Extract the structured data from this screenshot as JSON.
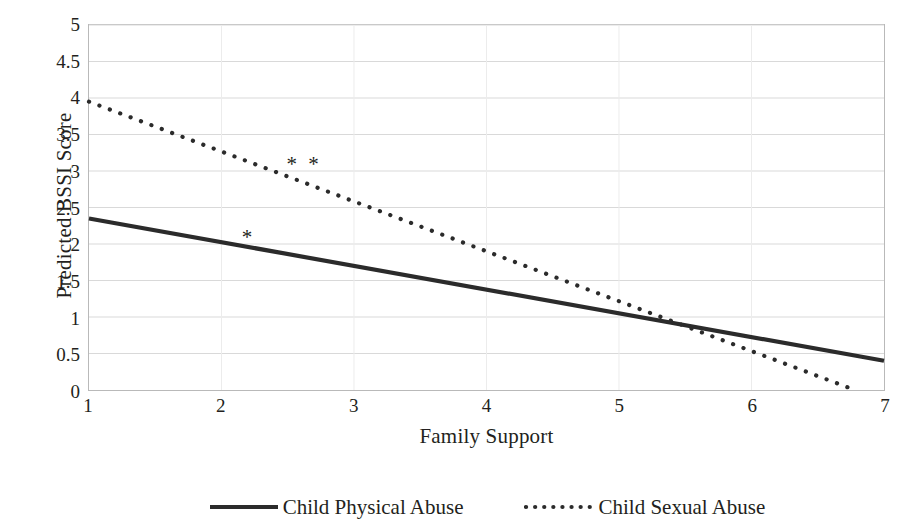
{
  "chart_data": {
    "type": "line",
    "title": "",
    "xlabel": "Family Support",
    "ylabel": "Predicted BSSI Score",
    "xlim": [
      1,
      7
    ],
    "ylim": [
      0,
      5
    ],
    "x_ticks": [
      "1",
      "2",
      "3",
      "4",
      "5",
      "6",
      "7"
    ],
    "y_ticks": [
      "0",
      "0.5",
      "1",
      "1.5",
      "2",
      "2.5",
      "3",
      "3.5",
      "4",
      "4.5",
      "5"
    ],
    "grid": "horizontal",
    "legend_position": "bottom",
    "series": [
      {
        "name": "Child Physical Abuse",
        "style": "solid",
        "color": "#2b2b2b",
        "x": [
          1,
          7
        ],
        "values": [
          2.35,
          0.4
        ]
      },
      {
        "name": "Child Sexual Abuse",
        "style": "dotted",
        "color": "#2b2b2b",
        "x": [
          1,
          6.78
        ],
        "values": [
          3.95,
          0.0
        ]
      }
    ],
    "annotations": [
      {
        "text": "*",
        "x": 2.2,
        "y": 2.18,
        "series": "Child Physical Abuse"
      },
      {
        "text": "* *",
        "x": 2.62,
        "y": 3.17,
        "series": "Child Sexual Abuse"
      }
    ]
  },
  "axes": {
    "y_title": "Predicted BSSI Score",
    "x_title": "Family Support",
    "y_tick_labels": [
      "5",
      "4.5",
      "4",
      "3.5",
      "3",
      "2.5",
      "2",
      "1.5",
      "1",
      "0.5",
      "0"
    ],
    "x_tick_labels": [
      "1",
      "2",
      "3",
      "4",
      "5",
      "6",
      "7"
    ]
  },
  "legend": {
    "entries": [
      {
        "label": "Child Physical Abuse",
        "style": "solid"
      },
      {
        "label": "Child Sexual Abuse",
        "style": "dotted"
      }
    ]
  },
  "colors": {
    "line": "#2b2b2b",
    "grid": "#d9d9d9",
    "frame": "#b9b9b9",
    "text": "#231f20"
  }
}
